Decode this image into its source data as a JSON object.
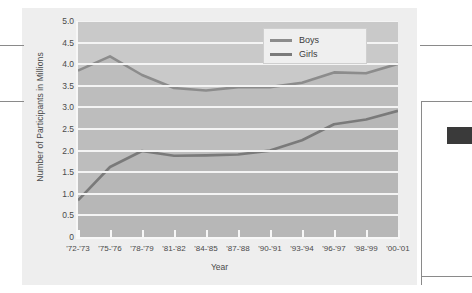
{
  "chart_data": {
    "type": "line",
    "title": "",
    "xlabel": "Year",
    "ylabel": "Number of Participants in Millions",
    "categories": [
      "'72-'73",
      "'75-'76",
      "'78-'79",
      "'81-'82",
      "'84-'85",
      "'87-'88",
      "'90-'91",
      "'93-'94",
      "'96-'97",
      "'98-'99",
      "'00-'01"
    ],
    "ylim": [
      0,
      5.0
    ],
    "yticks": [
      "0",
      "0.5",
      "1.0",
      "1.5",
      "2.0",
      "2.5",
      "3.0",
      "3.5",
      "4.0",
      "4.5",
      "5.0"
    ],
    "ytick_values": [
      0,
      0.5,
      1.0,
      1.5,
      2.0,
      2.5,
      3.0,
      3.5,
      4.0,
      4.5,
      5.0
    ],
    "grid": true,
    "legend_position": "top-right",
    "series": [
      {
        "name": "Boys",
        "color": "#8c8c8c",
        "values": [
          3.85,
          4.18,
          3.75,
          3.45,
          3.39,
          3.47,
          3.47,
          3.57,
          3.81,
          3.79,
          4.01
        ]
      },
      {
        "name": "Girls",
        "color": "#7a7a7a",
        "values": [
          0.85,
          1.62,
          1.99,
          1.88,
          1.89,
          1.91,
          2.0,
          2.24,
          2.61,
          2.72,
          2.92
        ]
      }
    ]
  },
  "legend": {
    "items": [
      {
        "label": "Boys"
      },
      {
        "label": "Girls"
      }
    ]
  },
  "colors": {
    "plot_background": "#c9c9c9",
    "gridline": "#f4f4f4",
    "boys_line": "#8c8c8c",
    "girls_line": "#7a7a7a",
    "text": "#4a4a4a",
    "accent_tab": "#3a3a3a"
  }
}
